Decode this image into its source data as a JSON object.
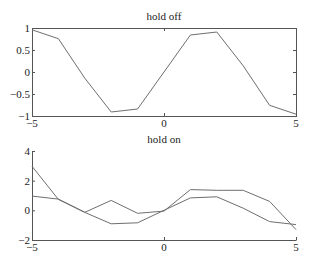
{
  "chart_data": [
    {
      "type": "line",
      "title": "hold off",
      "xlabel": "",
      "ylabel": "",
      "x": [
        -5,
        -4,
        -3,
        -2,
        -1,
        0,
        1,
        2,
        3,
        4,
        5
      ],
      "series": [
        {
          "name": "sin(x)",
          "values": [
            0.959,
            0.757,
            -0.141,
            -0.909,
            -0.841,
            0,
            0.841,
            0.909,
            0.141,
            -0.757,
            -0.959
          ]
        }
      ],
      "xlim": [
        -5,
        5
      ],
      "ylim": [
        -1,
        1
      ],
      "xticks": [
        -5,
        0,
        5
      ],
      "xtick_labels": [
        "−5",
        "0",
        "5"
      ],
      "yticks": [
        1,
        0.5,
        0,
        -0.5,
        -1
      ],
      "ytick_labels": [
        "1",
        "0.5",
        "0",
        "−0.5",
        "−1"
      ],
      "box": true,
      "grid": false,
      "legend": null
    },
    {
      "type": "line",
      "title": "hold on",
      "xlabel": "",
      "ylabel": "",
      "x": [
        -5,
        -4,
        -3,
        -2,
        -1,
        0,
        1,
        2,
        3,
        4,
        5
      ],
      "series": [
        {
          "name": "sin(x)",
          "values": [
            0.959,
            0.757,
            -0.141,
            -0.909,
            -0.841,
            0,
            0.841,
            0.909,
            0.141,
            -0.757,
            -0.959
          ]
        },
        {
          "name": "series 2",
          "values": [
            2.97,
            0.74,
            -0.13,
            0.67,
            -0.2,
            -0.05,
            1.4,
            1.35,
            1.35,
            0.6,
            -1.3
          ]
        }
      ],
      "xlim": [
        -5,
        5
      ],
      "ylim": [
        -2,
        4
      ],
      "xticks": [
        -5,
        0,
        5
      ],
      "xtick_labels": [
        "−5",
        "0",
        "5"
      ],
      "yticks": [
        4,
        2,
        0,
        -2
      ],
      "ytick_labels": [
        "4",
        "2",
        "0",
        "−2"
      ],
      "box": false,
      "grid": false,
      "legend": null
    }
  ],
  "style": {
    "line_color": "#6e6e6e",
    "axis_color": "#555555",
    "text_color": "#222222"
  },
  "layout": {
    "axes": [
      {
        "left": 32,
        "top": 28,
        "right": 296,
        "bottom": 116,
        "title_y": 20
      },
      {
        "left": 32,
        "top": 151,
        "right": 296,
        "bottom": 240,
        "title_y": 143
      }
    ]
  }
}
